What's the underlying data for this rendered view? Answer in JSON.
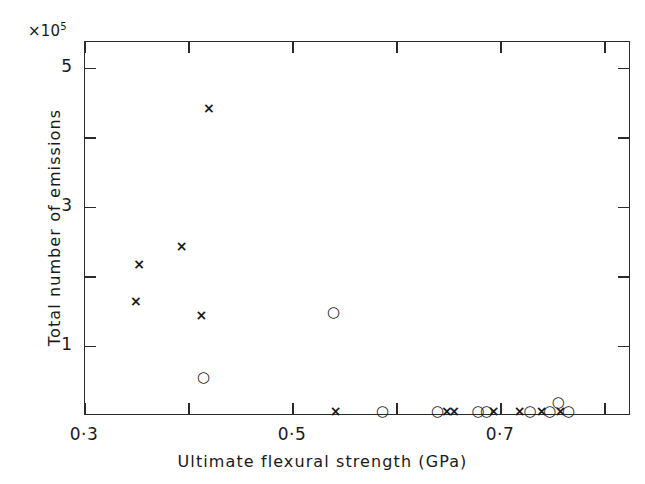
{
  "figure": {
    "exponent_label": "×10",
    "exponent_sup": "5",
    "xaxis_title": "Ultimate flexural strength (GPa)",
    "yaxis_title": "Total number of emissions"
  },
  "axes": {
    "x_ticks_major": [
      {
        "value": 0.3,
        "label": "0·3"
      },
      {
        "value": 0.5,
        "label": "0·5"
      },
      {
        "value": 0.7,
        "label": "0·7"
      }
    ],
    "x_ticks_minor": [
      0.4,
      0.6,
      0.8
    ],
    "y_ticks_major": [
      {
        "value": 1,
        "label": "1"
      },
      {
        "value": 3,
        "label": "3"
      },
      {
        "value": 5,
        "label": "5"
      }
    ],
    "y_ticks_minor": [
      2,
      4
    ]
  },
  "chart_data": {
    "type": "scatter",
    "title": "",
    "xlabel": "Ultimate flexural strength (GPa)",
    "ylabel": "Total number of emissions",
    "y_multiplier": "×10^5",
    "xlim": [
      0.3,
      0.825
    ],
    "ylim": [
      0.0,
      5.38
    ],
    "grid": false,
    "legend": "none",
    "series": [
      {
        "name": "cross",
        "marker": "×",
        "points": [
          {
            "x": 0.419,
            "y": 4.43
          },
          {
            "x": 0.393,
            "y": 2.44
          },
          {
            "x": 0.352,
            "y": 2.19
          },
          {
            "x": 0.349,
            "y": 1.66
          },
          {
            "x": 0.412,
            "y": 1.46
          },
          {
            "x": 0.541,
            "y": 0.07
          },
          {
            "x": 0.648,
            "y": 0.07
          },
          {
            "x": 0.655,
            "y": 0.07
          },
          {
            "x": 0.693,
            "y": 0.07
          },
          {
            "x": 0.718,
            "y": 0.07
          },
          {
            "x": 0.739,
            "y": 0.07
          },
          {
            "x": 0.757,
            "y": 0.07
          }
        ]
      },
      {
        "name": "circle",
        "marker": "○",
        "points": [
          {
            "x": 0.539,
            "y": 1.49
          },
          {
            "x": 0.414,
            "y": 0.56
          },
          {
            "x": 0.586,
            "y": 0.07
          },
          {
            "x": 0.639,
            "y": 0.07
          },
          {
            "x": 0.678,
            "y": 0.07
          },
          {
            "x": 0.686,
            "y": 0.07
          },
          {
            "x": 0.728,
            "y": 0.07
          },
          {
            "x": 0.747,
            "y": 0.07
          },
          {
            "x": 0.755,
            "y": 0.2
          },
          {
            "x": 0.765,
            "y": 0.07
          }
        ]
      }
    ]
  }
}
